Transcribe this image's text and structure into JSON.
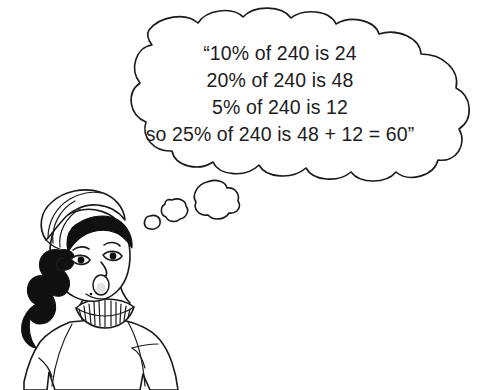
{
  "illustration": {
    "title": "Girl thinking about percentages of 240",
    "style": "black-and-white line drawing",
    "background_color": "#ffffff",
    "ink_color": "#1a1a1a",
    "hair_color": "#101010"
  },
  "thought_bubble": {
    "name": "thought-cloud",
    "open_quote": "“",
    "close_quote": "”",
    "lines": [
      "“10% of 240 is 24",
      "20% of 240 is 48",
      "5% of 240 is 12",
      "so 25% of 240 is 48 + 12 = 60”"
    ],
    "full_text": "“10% of 240 is 24 20% of 240 is 48 5% of 240 is 12 so 25% of 240 is 48 + 12 = 60”",
    "trail_bubbles": [
      {
        "label": "large-trail-bubble"
      },
      {
        "label": "medium-trail-bubble"
      },
      {
        "label": "small-trail-bubble"
      }
    ]
  },
  "math_content": {
    "base_number": "240",
    "steps": [
      {
        "percent": "10%",
        "of": "240",
        "result": "24"
      },
      {
        "percent": "20%",
        "of": "240",
        "result": "48"
      },
      {
        "percent": "5%",
        "of": "240",
        "result": "12"
      },
      {
        "percent": "25%",
        "of": "240",
        "expression": "48 + 12",
        "result": "60"
      }
    ]
  },
  "character": {
    "name": "girl-thinking",
    "features": [
      "headwrap",
      "braid",
      "fringe",
      "open-mouth",
      "ruffled-collar",
      "loose-top"
    ]
  }
}
